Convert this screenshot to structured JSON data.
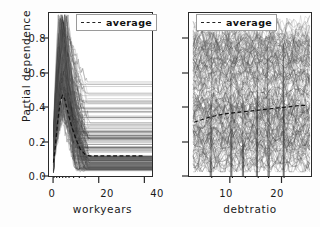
{
  "figure": {
    "ylabel": "Partial dependence",
    "background": "#ffffff",
    "frame_color": "#2a2a2a"
  },
  "chart_data": [
    {
      "type": "line",
      "panel": "left",
      "title": "",
      "xlabel": "workyears",
      "ylabel": "Partial dependence",
      "xlim": [
        -2,
        44
      ],
      "ylim": [
        -0.02,
        0.95
      ],
      "xticks": [
        0,
        20,
        40
      ],
      "xticklabels": [
        "0",
        "20",
        "40"
      ],
      "yticks": [
        0.0,
        0.2,
        0.4,
        0.6,
        0.8
      ],
      "yticklabels": [
        "0.0",
        "0.2",
        "0.4",
        "0.6",
        "0.8"
      ],
      "grid": false,
      "legend": [
        {
          "label": "average",
          "style": "dashed",
          "color": "#222222"
        }
      ],
      "legend_position": "upper right",
      "description": "Individual conditional expectation (ICE) curves: dense bundle of partial dependence curves rising steeply between workyears 0 and 6, peaking near 0.9, then dropping to flat plateaus spread between 0.02 and 0.55 from workyears 14 to 40.",
      "n_curves": 180,
      "rug_ticks": [
        0.4,
        1.6,
        2.8,
        4.2,
        5.6,
        7.0,
        9.0,
        11.5,
        14.0
      ],
      "series": [
        {
          "name": "average",
          "style": "dashed",
          "x": [
            0,
            1,
            2,
            3,
            4,
            5,
            6,
            8,
            10,
            12,
            14,
            16,
            20,
            25,
            30,
            35,
            40
          ],
          "values": [
            0.06,
            0.18,
            0.32,
            0.42,
            0.46,
            0.44,
            0.38,
            0.28,
            0.2,
            0.14,
            0.11,
            0.1,
            0.1,
            0.1,
            0.1,
            0.1,
            0.1
          ]
        }
      ]
    },
    {
      "type": "line",
      "panel": "right",
      "title": "",
      "xlabel": "debtratio",
      "ylabel": "",
      "xlim": [
        2,
        26
      ],
      "ylim": [
        -0.02,
        0.95
      ],
      "xticks": [
        10,
        20
      ],
      "xticklabels": [
        "10",
        "20"
      ],
      "yticks": [
        0.0,
        0.2,
        0.4,
        0.6,
        0.8
      ],
      "yticklabels": [
        "",
        "",
        "",
        "",
        ""
      ],
      "grid": false,
      "legend": [
        {
          "label": "average",
          "style": "dashed",
          "color": "#222222"
        }
      ],
      "legend_position": "upper left",
      "description": "Individual conditional expectation (ICE) curves: dense bundle of noisy, wiggly partial dependence curves spanning the full debtratio range from about 3 to 25, spread across the full 0.0 to 0.9 vertical range with heavy overplotting.",
      "n_curves": 180,
      "rug_ticks": [
        6.5,
        10.5,
        13.0,
        15.5,
        17.5,
        20.5
      ],
      "series": [
        {
          "name": "average",
          "style": "dashed",
          "x": [
            3,
            6,
            9,
            12,
            15,
            18,
            21,
            24,
            25
          ],
          "values": [
            0.3,
            0.33,
            0.35,
            0.36,
            0.37,
            0.38,
            0.39,
            0.4,
            0.4
          ]
        }
      ]
    }
  ]
}
